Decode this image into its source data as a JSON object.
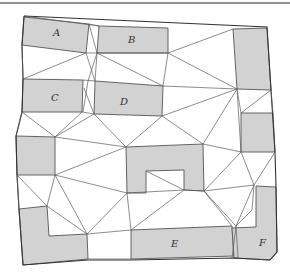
{
  "diagram": {
    "type": "polygon-triangulation",
    "colors": {
      "room_fill": "#d2d2d2",
      "edge": "#5a5a5a",
      "background": "#ffffff"
    },
    "labels": [
      {
        "id": "A",
        "text": "A",
        "x": 53,
        "y": 36
      },
      {
        "id": "B",
        "text": "B",
        "x": 131,
        "y": 42
      },
      {
        "id": "C",
        "text": "C",
        "x": 52,
        "y": 100
      },
      {
        "id": "D",
        "text": "D",
        "x": 124,
        "y": 104
      },
      {
        "id": "E",
        "text": "E",
        "x": 174,
        "y": 246
      },
      {
        "id": "F",
        "text": "F",
        "x": 262,
        "y": 245
      }
    ]
  }
}
